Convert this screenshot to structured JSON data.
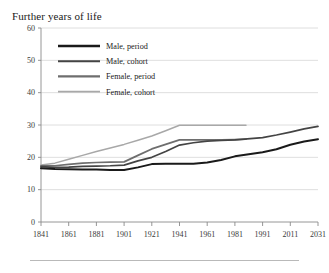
{
  "figure": {
    "title": "Further years of life",
    "background_color": "#ffffff",
    "footer_rule": true
  },
  "chart_data": {
    "type": "line",
    "title": "Further years of life",
    "xlabel": "",
    "ylabel": "",
    "xlim": [
      1841,
      2031
    ],
    "ylim": [
      0,
      60
    ],
    "grid": true,
    "grid_axis": "y",
    "legend_position": "upper left",
    "xtick_labels": [
      "1841",
      "1861",
      "1881",
      "1901",
      "1921",
      "1941",
      "1961",
      "1981",
      "1991",
      "2011",
      "2031"
    ],
    "xtick_values": [
      1841,
      1861,
      1881,
      1901,
      1921,
      1941,
      1961,
      1981,
      1991,
      2011,
      2031
    ],
    "ytick_labels": [
      "0",
      "10",
      "20",
      "30",
      "40",
      "50",
      "60"
    ],
    "ytick_values": [
      0,
      10,
      20,
      30,
      40,
      50,
      60
    ],
    "series": [
      {
        "name": "Male, period",
        "color": "#1a1a1a",
        "width": 2.0,
        "x": [
          1841,
          1851,
          1861,
          1871,
          1881,
          1891,
          1901,
          1911,
          1921,
          1931,
          1941,
          1951,
          1961,
          1971,
          1981,
          1991,
          2001,
          2011,
          2021,
          2031
        ],
        "values": [
          16.6,
          16.4,
          16.3,
          16.2,
          16.2,
          16.1,
          16.1,
          16.9,
          17.9,
          18.0,
          18.0,
          18.0,
          18.4,
          19.2,
          20.3,
          21.6,
          22.5,
          23.9,
          24.9,
          25.6
        ]
      },
      {
        "name": "Male, cohort",
        "color": "#444444",
        "width": 1.7,
        "x": [
          1841,
          1851,
          1861,
          1871,
          1881,
          1891,
          1901,
          1911,
          1921,
          1931,
          1941,
          1951,
          1961,
          1971,
          1981,
          1991,
          2001,
          2011,
          2021,
          2031
        ],
        "values": [
          17.1,
          16.9,
          17.0,
          17.2,
          17.3,
          17.4,
          17.6,
          18.9,
          20.0,
          21.8,
          23.8,
          24.5,
          25.0,
          25.2,
          25.4,
          26.1,
          26.9,
          27.8,
          28.8,
          29.6
        ]
      },
      {
        "name": "Female, period",
        "color": "#6e6e6e",
        "width": 1.7,
        "x": [
          1841,
          1851,
          1861,
          1871,
          1881,
          1891,
          1901,
          1911,
          1921,
          1931,
          1941,
          1951,
          1961,
          1971,
          1981,
          1985
        ],
        "values": [
          17.4,
          17.4,
          17.8,
          18.2,
          18.4,
          18.5,
          18.6,
          20.6,
          22.6,
          24.0,
          25.4,
          25.4,
          25.4,
          25.4,
          25.5,
          25.6
        ]
      },
      {
        "name": "Female, cohort",
        "color": "#a8a8a8",
        "width": 1.5,
        "x": [
          1841,
          1851,
          1861,
          1871,
          1881,
          1891,
          1901,
          1911,
          1921,
          1931,
          1941,
          1951,
          1961,
          1971,
          1981,
          1985
        ],
        "values": [
          17.6,
          18.2,
          19.4,
          20.6,
          21.8,
          22.9,
          24.0,
          25.3,
          26.6,
          28.2,
          29.9,
          29.9,
          29.9,
          29.9,
          29.9,
          29.9
        ]
      }
    ],
    "legend_entries": [
      {
        "label": "Male, period",
        "color": "#1a1a1a"
      },
      {
        "label": "Male, cohort",
        "color": "#444444"
      },
      {
        "label": "Female, period",
        "color": "#6e6e6e"
      },
      {
        "label": "Female, cohort",
        "color": "#a8a8a8"
      }
    ]
  }
}
